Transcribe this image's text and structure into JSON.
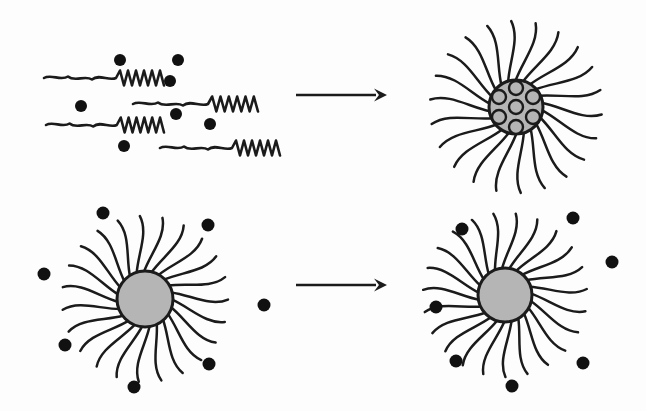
{
  "figure": {
    "background_color": "#fdfdfd",
    "ink_color": "#1b1b1b",
    "solute_color": "#111111",
    "core_fill_color": "#b5b5b5",
    "width": 646,
    "height": 411,
    "panel_labels": {
      "top_left": "free-surfactant-chains-with-solute",
      "top_right": "loaded-micelle-solute-encapsulated-in-core",
      "bottom_left": "preformed-empty-micelle-with-external-solute",
      "bottom_right": "empty-micelle-solute-remains-external"
    }
  },
  "chart_data": {
    "type": "diagram",
    "title": "",
    "rows": [
      {
        "row_index": 0,
        "reactant_panel": "free surfactant chains dispersed with solute particles",
        "arrow": "right-arrow",
        "product_panel": "micelle with solute particles encapsulated inside the core",
        "chain_count": 4,
        "solute_count_left": 7,
        "encapsulated_solute_count": 7,
        "external_solute_count_right": 0,
        "tail_count": 22
      },
      {
        "row_index": 1,
        "reactant_panel": "preformed empty micelle surrounded by solute particles",
        "arrow": "right-arrow",
        "product_panel": "empty micelle, solute particles remain outside",
        "chain_count": 0,
        "solute_count_left": 7,
        "encapsulated_solute_count": 0,
        "external_solute_count_right": 7,
        "tail_count": 23
      }
    ]
  },
  "top_left": {
    "name": "free-chains-panel",
    "chains": [
      {
        "x": 44,
        "y": 78,
        "length": 120,
        "wave_amp": 4.5,
        "zig_amp": 7.5,
        "zig_count": 6
      },
      {
        "x": 133,
        "y": 104,
        "length": 125,
        "wave_amp": 4.5,
        "zig_amp": 7.5,
        "zig_count": 6
      },
      {
        "x": 46,
        "y": 125,
        "length": 118,
        "wave_amp": 4.5,
        "zig_amp": 7.5,
        "zig_count": 6
      },
      {
        "x": 160,
        "y": 148,
        "length": 120,
        "wave_amp": 4.5,
        "zig_amp": 7.5,
        "zig_count": 6
      }
    ],
    "solute_dots": [
      {
        "cx": 120,
        "cy": 60,
        "r": 6
      },
      {
        "cx": 178,
        "cy": 60,
        "r": 6
      },
      {
        "cx": 170,
        "cy": 81,
        "r": 6
      },
      {
        "cx": 81,
        "cy": 106,
        "r": 6
      },
      {
        "cx": 176,
        "cy": 114,
        "r": 6
      },
      {
        "cx": 210,
        "cy": 124,
        "r": 6
      },
      {
        "cx": 124,
        "cy": 146,
        "r": 6
      }
    ]
  },
  "top_right": {
    "name": "loaded-micelle",
    "core": {
      "cx": 516,
      "cy": 107,
      "r": 27
    },
    "tail_count": 22,
    "tail_length": 60,
    "encapsulated": [
      {
        "cx": 516,
        "cy": 107,
        "r": 7
      },
      {
        "cx": 516,
        "cy": 88,
        "r": 7
      },
      {
        "cx": 499,
        "cy": 97,
        "r": 7
      },
      {
        "cx": 533,
        "cy": 97,
        "r": 7
      },
      {
        "cx": 499,
        "cy": 117,
        "r": 7
      },
      {
        "cx": 533,
        "cy": 117,
        "r": 7
      },
      {
        "cx": 516,
        "cy": 127,
        "r": 7
      }
    ]
  },
  "bottom_left": {
    "name": "empty-micelle-with-external-solute",
    "core": {
      "cx": 145,
      "cy": 299,
      "r": 28
    },
    "tail_count": 23,
    "tail_length": 56,
    "solute_dots": [
      {
        "cx": 103,
        "cy": 213,
        "r": 6.5
      },
      {
        "cx": 208,
        "cy": 225,
        "r": 6.5
      },
      {
        "cx": 44,
        "cy": 274,
        "r": 6.5
      },
      {
        "cx": 264,
        "cy": 305,
        "r": 6.5
      },
      {
        "cx": 65,
        "cy": 345,
        "r": 6.5
      },
      {
        "cx": 209,
        "cy": 364,
        "r": 6.5
      },
      {
        "cx": 134,
        "cy": 387,
        "r": 6.5
      }
    ]
  },
  "bottom_right": {
    "name": "empty-micelle-solute-still-external",
    "core": {
      "cx": 505,
      "cy": 295,
      "r": 27
    },
    "tail_count": 23,
    "tail_length": 56,
    "solute_dots": [
      {
        "cx": 573,
        "cy": 218,
        "r": 6.5
      },
      {
        "cx": 462,
        "cy": 229,
        "r": 6.5
      },
      {
        "cx": 612,
        "cy": 262,
        "r": 6.5
      },
      {
        "cx": 436,
        "cy": 307,
        "r": 6.5
      },
      {
        "cx": 456,
        "cy": 361,
        "r": 6.5
      },
      {
        "cx": 583,
        "cy": 363,
        "r": 6.5
      },
      {
        "cx": 512,
        "cy": 386,
        "r": 6.5
      }
    ]
  },
  "arrows": [
    {
      "name": "top-arrow",
      "x1": 296,
      "y1": 95,
      "x2": 387,
      "y2": 95,
      "head": 13
    },
    {
      "name": "bottom-arrow",
      "x1": 296,
      "y1": 285,
      "x2": 387,
      "y2": 285,
      "head": 13
    }
  ]
}
